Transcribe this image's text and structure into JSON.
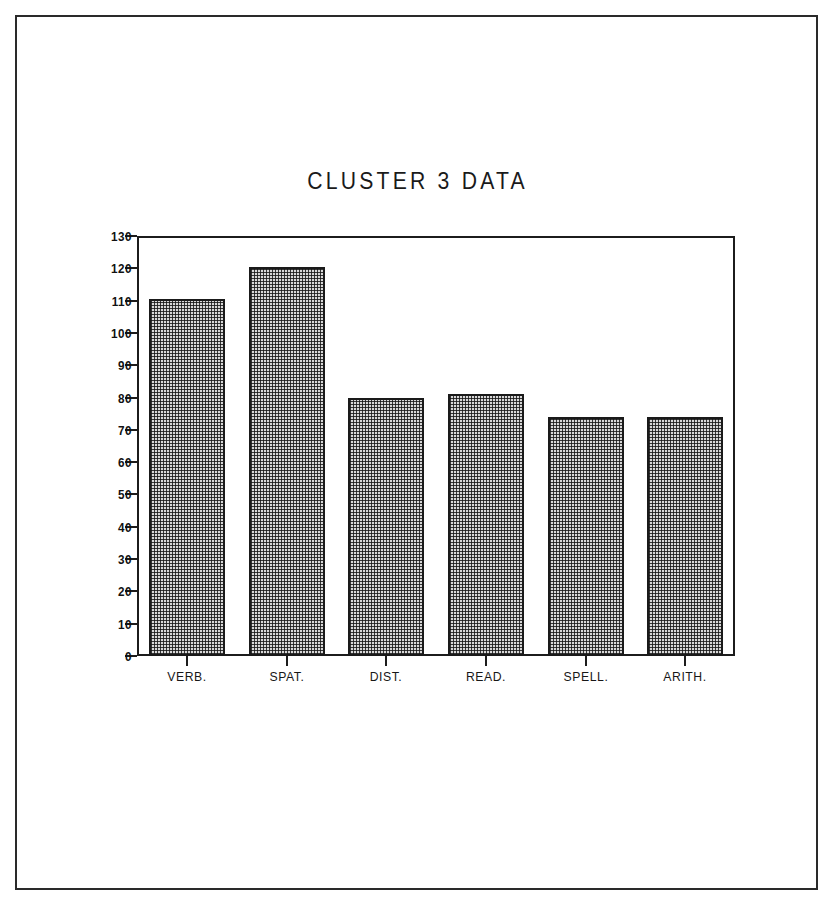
{
  "chart_data": {
    "type": "bar",
    "title": "CLUSTER 3 DATA",
    "xlabel": "",
    "ylabel": "",
    "categories": [
      "VERB.",
      "SPAT.",
      "DIST.",
      "READ.",
      "SPELL.",
      "ARITH."
    ],
    "values": [
      110.5,
      120.5,
      80,
      81,
      74,
      74
    ],
    "ylim": [
      0,
      130
    ],
    "ytick_labels": [
      "130",
      "120",
      "110",
      "100",
      "90",
      "80",
      "70",
      "60",
      "50",
      "40",
      "30",
      "20",
      "10",
      "0"
    ],
    "ytick_values": [
      130,
      120,
      110,
      100,
      90,
      80,
      70,
      60,
      50,
      40,
      30,
      20,
      10,
      0
    ],
    "grid": false,
    "legend": false,
    "bar_fill_color": "#d8d8d8",
    "bar_edge_color": "#1a1a1a",
    "axis_color": "#1c1c1c",
    "background_color": "#ffffff"
  }
}
